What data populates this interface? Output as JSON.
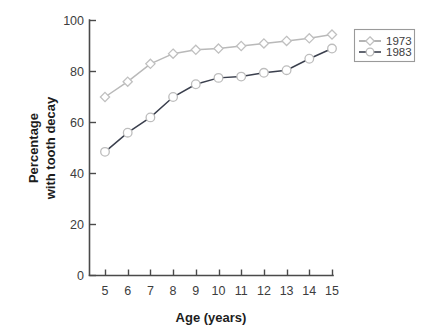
{
  "chart_data": {
    "type": "line",
    "title": "",
    "xlabel": "Age (years)",
    "ylabel": "Percentage with tooth decay",
    "ylabel_line1": "Percentage",
    "ylabel_line2": "with tooth decay",
    "x": [
      5,
      6,
      7,
      8,
      9,
      10,
      11,
      12,
      13,
      14,
      15
    ],
    "xtick_labels": [
      "5",
      "6",
      "7",
      "8",
      "9",
      "10",
      "11",
      "12",
      "13",
      "14",
      "15"
    ],
    "ytick_labels": [
      "0",
      "20",
      "40",
      "60",
      "80",
      "100"
    ],
    "yticks": [
      0,
      20,
      40,
      60,
      80,
      100
    ],
    "xlim": [
      5,
      15
    ],
    "ylim": [
      0,
      100
    ],
    "grid": false,
    "legend_position": "top-right-outside",
    "series": [
      {
        "name": "1973",
        "marker": "diamond",
        "color": "#b9b9b9",
        "values": [
          70,
          76,
          83,
          87,
          88.5,
          89,
          90,
          91,
          92,
          93,
          94.5
        ]
      },
      {
        "name": "1983",
        "marker": "circle",
        "color": "#3a3f4d",
        "values": [
          48.5,
          56,
          62,
          70,
          75,
          77.5,
          78,
          79.5,
          80.5,
          85,
          89
        ]
      }
    ]
  },
  "legend": {
    "items": [
      {
        "label": "1973"
      },
      {
        "label": "1983"
      }
    ]
  }
}
